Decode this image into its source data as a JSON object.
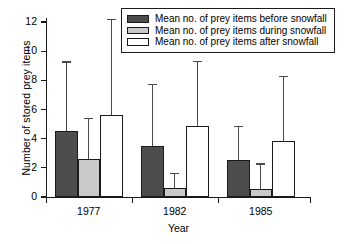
{
  "chart_data": {
    "type": "bar",
    "title": "",
    "xlabel": "Year",
    "ylabel": "Number of stored prey items",
    "categories": [
      "1977",
      "1982",
      "1985"
    ],
    "ylim": [
      0,
      12
    ],
    "yticks": [
      0,
      2,
      4,
      6,
      8,
      10,
      12
    ],
    "grid": false,
    "legend_position": "top-right",
    "error_bars": "upper only (SD)",
    "series": [
      {
        "name": "Mean no. of prey items before snowfall",
        "color": "#4d4d4d",
        "values": [
          4.5,
          3.5,
          2.55
        ],
        "error_upper": [
          9.3,
          7.75,
          4.9
        ]
      },
      {
        "name": "Mean no. of prey items during snowfall",
        "color": "#c9c9c9",
        "values": [
          2.6,
          0.6,
          0.55
        ],
        "error_upper": [
          5.45,
          1.65,
          2.3
        ]
      },
      {
        "name": "Mean no. of prey items after snowfall",
        "color": "#ffffff",
        "values": [
          5.6,
          4.85,
          3.85
        ],
        "error_upper": [
          12.2,
          9.35,
          8.3
        ]
      }
    ]
  },
  "axis": {
    "ytick_labels": [
      "0",
      "2",
      "4",
      "6",
      "8",
      "10",
      "12"
    ],
    "xtick_labels": [
      "1977",
      "1982",
      "1985"
    ],
    "x_title": "Year",
    "y_title": "Number of stored prey items"
  },
  "legend": {
    "items": [
      {
        "label": "Mean no. of prey items before snowfall"
      },
      {
        "label": "Mean no. of prey items during snowfall"
      },
      {
        "label": "Mean no. of prey items after snowfall"
      }
    ]
  }
}
